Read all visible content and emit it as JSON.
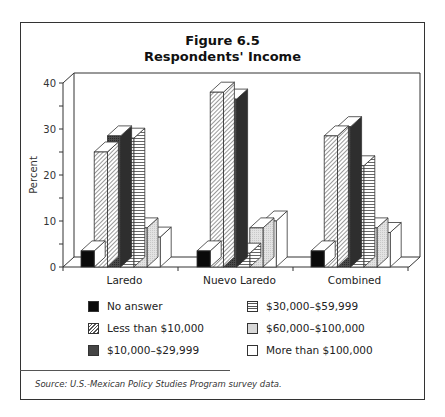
{
  "figure": {
    "title": "Figure 6.5",
    "subtitle": "Respondents' Income",
    "source": "Source:  U.S.-Mexican Policy Studies Program survey data."
  },
  "chart_data": {
    "type": "bar",
    "style": "3d-grouped",
    "xlabel": "",
    "ylabel": "Percent",
    "ylim": [
      0,
      40
    ],
    "yticks": [
      0,
      10,
      20,
      30,
      40
    ],
    "grid": false,
    "legend_position": "bottom",
    "categories": [
      "Laredo",
      "Nuevo Laredo",
      "Combined"
    ],
    "series": [
      {
        "name": "No answer",
        "pattern": "solid-black",
        "values": [
          3.5,
          3.5,
          3.5
        ]
      },
      {
        "name": "Less than $10,000",
        "pattern": "diagonal-hatch",
        "values": [
          25,
          38,
          28.5
        ]
      },
      {
        "name": "$10,000–$29,999",
        "pattern": "dark-gray",
        "values": [
          28.5,
          36.5,
          30.5
        ]
      },
      {
        "name": "$30,000–$59,999",
        "pattern": "horizontal-lines",
        "values": [
          28,
          3,
          22
        ]
      },
      {
        "name": "$60,000–$100,000",
        "pattern": "light-gray",
        "values": [
          8.5,
          8.5,
          8.5
        ]
      },
      {
        "name": "More than $100,000",
        "pattern": "white",
        "values": [
          6.5,
          10,
          7.5
        ]
      }
    ]
  },
  "legend": {
    "left": [
      {
        "label": "No answer",
        "swatch": "sw-black"
      },
      {
        "label": "Less than $10,000",
        "swatch": "sw-diag"
      },
      {
        "label": "$10,000–$29,999",
        "swatch": "sw-dark"
      }
    ],
    "right": [
      {
        "label": "$30,000–$59,999",
        "swatch": "sw-horiz"
      },
      {
        "label": "$60,000–$100,000",
        "swatch": "sw-light"
      },
      {
        "label": "More than $100,000",
        "swatch": "sw-white"
      }
    ]
  }
}
